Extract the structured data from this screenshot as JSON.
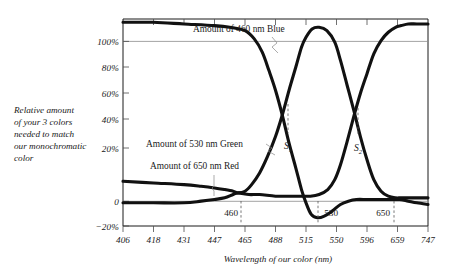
{
  "figure": {
    "background": "#ffffff",
    "ink": "#111111",
    "grid_color": "#8c8c8c"
  },
  "axis": {
    "y_title_lines": [
      "Relative amount",
      "of your 3 colors",
      "needed to match",
      "our monochromatic",
      "color"
    ],
    "x_title": "Wavelength of our color (nm)",
    "y_ticklabels": [
      "100%",
      "80%",
      "60%",
      "40%",
      "20%",
      "0",
      "−20%"
    ],
    "x_ticklabels": [
      "406",
      "418",
      "431",
      "447",
      "465",
      "488",
      "515",
      "550",
      "596",
      "659",
      "747"
    ]
  },
  "annotations": {
    "blue_label": "Amount of 460 nm Blue",
    "green_label": "Amount of 530 nm Green",
    "red_label": "Amount of 650 nm Red",
    "s1": "S",
    "s1_sub": "1",
    "s2": "S",
    "s2_sub": "2",
    "marker_460": "460",
    "marker_530": "530",
    "marker_650": "650"
  },
  "chart_data": {
    "type": "line",
    "title": "",
    "subtitle": "",
    "xlabel": "Wavelength of our color (nm)",
    "ylabel": "Relative amount of your 3 colors needed to match our monochromatic color",
    "xlim": [
      406,
      747
    ],
    "ylim": [
      -20,
      105
    ],
    "x_tick_values": [
      406,
      418,
      431,
      447,
      465,
      488,
      515,
      550,
      596,
      659,
      747
    ],
    "x_tick_labels": [
      "406",
      "418",
      "431",
      "447",
      "465",
      "488",
      "515",
      "550",
      "596",
      "659",
      "747"
    ],
    "y_tick_values": [
      100,
      80,
      60,
      40,
      20,
      0,
      -20
    ],
    "y_tick_labels": [
      "100%",
      "80%",
      "60%",
      "40%",
      "20%",
      "0",
      "−20%"
    ],
    "grid": "horizontal-at-0-and-100",
    "legend": "inline-annotations",
    "axis_note": "x axis is non-linear (perceptual wavelength spacing), ticks evenly spaced",
    "series": [
      {
        "name": "Amount of 460 nm Blue",
        "color": "#111111",
        "points": [
          [
            406,
            103
          ],
          [
            418,
            103
          ],
          [
            431,
            102
          ],
          [
            447,
            101
          ],
          [
            456,
            100
          ],
          [
            465,
            98
          ],
          [
            472,
            93
          ],
          [
            478,
            85
          ],
          [
            483,
            74
          ],
          [
            488,
            62
          ],
          [
            494,
            47
          ],
          [
            500,
            30
          ],
          [
            506,
            15
          ],
          [
            511,
            2
          ],
          [
            515,
            -6
          ],
          [
            521,
            -13
          ],
          [
            528,
            -15
          ],
          [
            536,
            -14
          ],
          [
            545,
            -11
          ],
          [
            556,
            -7
          ],
          [
            568,
            -5
          ],
          [
            580,
            -4
          ],
          [
            596,
            -4
          ],
          [
            620,
            -4
          ],
          [
            645,
            -4
          ],
          [
            665,
            -4
          ],
          [
            690,
            -5
          ],
          [
            715,
            -6
          ],
          [
            747,
            -7
          ]
        ]
      },
      {
        "name": "Amount of 530 nm Green",
        "color": "#111111",
        "points": [
          [
            406,
            7
          ],
          [
            418,
            6
          ],
          [
            431,
            5
          ],
          [
            440,
            4
          ],
          [
            447,
            3
          ],
          [
            453,
            2
          ],
          [
            458,
            1
          ],
          [
            461,
            0
          ],
          [
            465,
            1
          ],
          [
            470,
            5
          ],
          [
            476,
            12
          ],
          [
            482,
            22
          ],
          [
            488,
            34
          ],
          [
            494,
            47
          ],
          [
            500,
            62
          ],
          [
            506,
            76
          ],
          [
            511,
            88
          ],
          [
            515,
            94
          ],
          [
            522,
            99
          ],
          [
            530,
            100
          ],
          [
            539,
            98
          ],
          [
            548,
            91
          ],
          [
            556,
            80
          ],
          [
            566,
            65
          ],
          [
            576,
            50
          ],
          [
            586,
            34
          ],
          [
            596,
            20
          ],
          [
            610,
            8
          ],
          [
            625,
            1
          ],
          [
            640,
            -2
          ],
          [
            655,
            -3
          ],
          [
            670,
            -3
          ],
          [
            700,
            -3
          ],
          [
            747,
            -3
          ]
        ]
      },
      {
        "name": "Amount of 650 nm Red",
        "color": "#111111",
        "points": [
          [
            406,
            -6
          ],
          [
            418,
            -6
          ],
          [
            431,
            -6
          ],
          [
            440,
            -5
          ],
          [
            447,
            -4
          ],
          [
            453,
            -3
          ],
          [
            458,
            -1
          ],
          [
            461,
            0
          ],
          [
            468,
            -1
          ],
          [
            476,
            -1
          ],
          [
            488,
            -2
          ],
          [
            500,
            -2
          ],
          [
            510,
            -2
          ],
          [
            520,
            -2
          ],
          [
            530,
            -1
          ],
          [
            540,
            2
          ],
          [
            548,
            8
          ],
          [
            556,
            17
          ],
          [
            566,
            31
          ],
          [
            576,
            46
          ],
          [
            586,
            60
          ],
          [
            596,
            72
          ],
          [
            610,
            84
          ],
          [
            625,
            92
          ],
          [
            640,
            97
          ],
          [
            655,
            100
          ],
          [
            670,
            101
          ],
          [
            690,
            102
          ],
          [
            715,
            102
          ],
          [
            747,
            102
          ]
        ]
      }
    ],
    "crossings": [
      {
        "label": "S1",
        "x": 494,
        "y": 47,
        "note": "blue and green curves cross"
      },
      {
        "label": "S2",
        "x": 586,
        "y": 46,
        "note": "green and red curves cross"
      }
    ],
    "wavelength_markers": [
      {
        "label": "460",
        "x": 460
      },
      {
        "label": "530",
        "x": 530
      },
      {
        "label": "650",
        "x": 650
      }
    ]
  }
}
